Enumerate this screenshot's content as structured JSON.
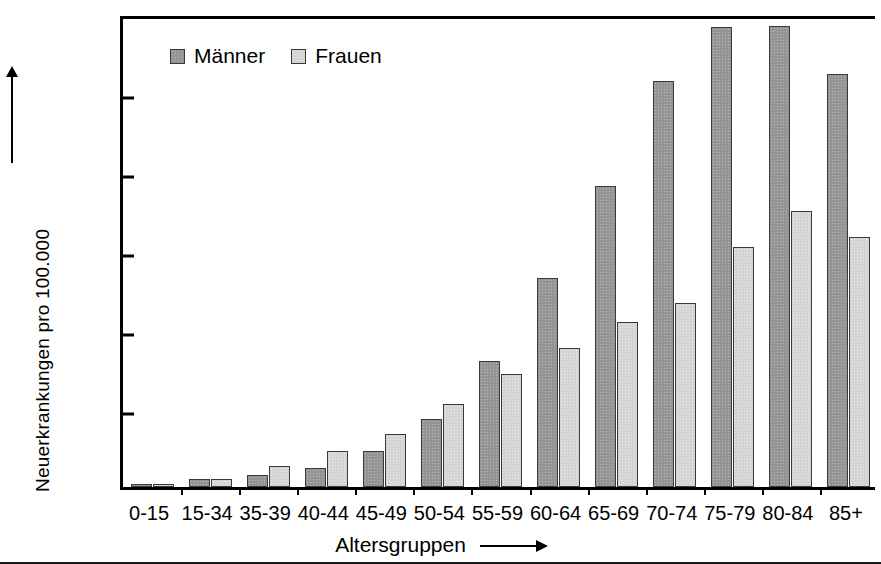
{
  "chart_data": {
    "type": "bar",
    "title": "",
    "xlabel": "Altersgruppen",
    "ylabel": "Neuerkrankungen pro 100.000",
    "categories": [
      "0-15",
      "15-34",
      "35-39",
      "40-44",
      "45-49",
      "50-54",
      "55-59",
      "60-64",
      "65-69",
      "70-74",
      "75-79",
      "80-84",
      "85+"
    ],
    "series": [
      {
        "name": "Männer",
        "color": "#949494",
        "values": [
          20,
          50,
          75,
          120,
          225,
          430,
          800,
          1320,
          1905,
          2570,
          2910,
          2920,
          2615
        ]
      },
      {
        "name": "Frauen",
        "color": "#d4d4d4",
        "values": [
          18,
          50,
          130,
          230,
          335,
          525,
          715,
          880,
          1045,
          1165,
          1520,
          1750,
          1580
        ]
      }
    ],
    "ylim": [
      0,
      3000
    ],
    "yticks": [
      0,
      500,
      1000,
      1500,
      2000,
      2500,
      3000
    ],
    "ytick_labels": [
      "0",
      "500",
      "1000",
      "1500",
      "2000",
      "2500",
      "3000"
    ],
    "grid": false,
    "legend_position": "top-left",
    "axis_arrows": {
      "y": "up-arrow",
      "x": "right-arrow"
    }
  }
}
